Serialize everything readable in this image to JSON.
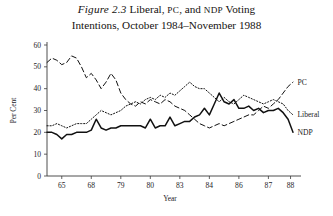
{
  "caption": {
    "figure_label": "Figure 2.3",
    "title_line1_a": "Liberal, ",
    "title_line1_pc": "PC",
    "title_line1_b": ", and ",
    "title_line1_ndp": "NDP",
    "title_line1_c": " Voting",
    "title_line2": "Intentions, October 1984–November 1988"
  },
  "chart_data": {
    "type": "line",
    "title": "Liberal, PC, and NDP Voting Intentions, October 1984–November 1988",
    "xlabel": "Year",
    "ylabel": "Per Cent",
    "ylim": [
      0,
      60
    ],
    "xlim": [
      0,
      100
    ],
    "grid": false,
    "legend": "inline-right-labels",
    "yticks": [
      0,
      10,
      20,
      30,
      40,
      50,
      60
    ],
    "ytick_labels": [
      "0",
      "10",
      "20",
      "30",
      "40",
      "50",
      "60"
    ],
    "xticks": [
      6,
      18,
      30,
      42,
      54,
      66,
      78,
      90,
      99
    ],
    "xtick_labels": [
      "65",
      "68",
      "79",
      "80",
      "83",
      "84",
      "86",
      "87",
      "88"
    ],
    "series": [
      {
        "name": "PC",
        "style": "dashed",
        "label_x": 101,
        "label_y": 43,
        "x": [
          0,
          2,
          4,
          6,
          8,
          10,
          12,
          14,
          16,
          18,
          20,
          22,
          24,
          26,
          28,
          30,
          32,
          34,
          36,
          38,
          40,
          42,
          44,
          46,
          48,
          50,
          52,
          54,
          56,
          58,
          60,
          62,
          64,
          66,
          68,
          70,
          72,
          74,
          76,
          78,
          80,
          82,
          84,
          86,
          88,
          90,
          92,
          94,
          96,
          98,
          100
        ],
        "values": [
          52,
          54,
          53,
          51,
          52,
          55,
          54,
          50,
          45,
          47,
          44,
          40,
          43,
          47,
          44,
          38,
          35,
          33,
          32,
          34,
          33,
          35,
          34,
          33,
          35,
          34,
          32,
          31,
          30,
          28,
          26,
          24,
          23,
          22,
          23,
          24,
          23,
          24,
          25,
          26,
          27,
          28,
          28,
          30,
          32,
          31,
          33,
          35,
          38,
          41,
          43
        ]
      },
      {
        "name": "Liberal",
        "style": "dotted",
        "label_x": 101,
        "label_y": 28,
        "x": [
          0,
          2,
          4,
          6,
          8,
          10,
          12,
          14,
          16,
          18,
          20,
          22,
          24,
          26,
          28,
          30,
          32,
          34,
          36,
          38,
          40,
          42,
          44,
          46,
          48,
          50,
          52,
          54,
          56,
          58,
          60,
          62,
          64,
          66,
          68,
          70,
          72,
          74,
          76,
          78,
          80,
          82,
          84,
          86,
          88,
          90,
          92,
          94,
          96,
          98,
          100
        ],
        "values": [
          23,
          23,
          24,
          23,
          22,
          23,
          24,
          24,
          24,
          26,
          28,
          30,
          29,
          28,
          29,
          30,
          32,
          33,
          34,
          33,
          35,
          36,
          35,
          37,
          36,
          38,
          37,
          39,
          41,
          43,
          41,
          40,
          40,
          38,
          36,
          34,
          36,
          34,
          33,
          35,
          37,
          36,
          35,
          34,
          33,
          34,
          35,
          34,
          33,
          30,
          28
        ]
      },
      {
        "name": "NDP",
        "style": "solid",
        "label_x": 101,
        "label_y": 20,
        "x": [
          0,
          2,
          4,
          6,
          8,
          10,
          12,
          14,
          16,
          18,
          20,
          22,
          24,
          26,
          28,
          30,
          32,
          34,
          36,
          38,
          40,
          42,
          44,
          46,
          48,
          50,
          52,
          54,
          56,
          58,
          60,
          62,
          64,
          66,
          68,
          70,
          72,
          74,
          76,
          78,
          80,
          82,
          84,
          86,
          88,
          90,
          92,
          94,
          96,
          98,
          100
        ],
        "values": [
          20,
          20,
          19,
          17,
          19,
          19,
          20,
          20,
          20,
          21,
          26,
          22,
          21,
          22,
          22,
          23,
          23,
          23,
          23,
          23,
          22,
          26,
          22,
          23,
          23,
          27,
          23,
          24,
          25,
          25,
          27,
          28,
          31,
          28,
          33,
          38,
          34,
          33,
          35,
          31,
          31,
          32,
          30,
          31,
          29,
          30,
          30,
          31,
          29,
          26,
          20
        ]
      }
    ]
  }
}
